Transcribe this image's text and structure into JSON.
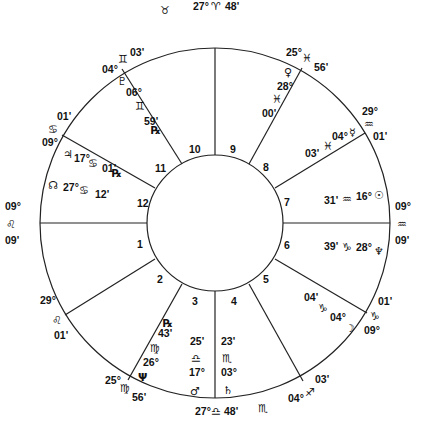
{
  "chart": {
    "house_numbers": [
      "1",
      "2",
      "3",
      "4",
      "5",
      "6",
      "7",
      "8",
      "9",
      "10",
      "11",
      "12"
    ],
    "cusps": {
      "mc": {
        "deg": "27°",
        "sign": "♈",
        "min": "48'"
      },
      "ic": {
        "deg": "27°",
        "sign": "♎",
        "min": "48'"
      },
      "asc": {
        "deg": "09°",
        "sign": "♌",
        "min": "09'"
      },
      "dsc": {
        "deg": "09°",
        "sign": "♒",
        "min": "09'"
      },
      "c11": {
        "deg": "04°",
        "sign": "♊",
        "min": "03'"
      },
      "c12": {
        "deg": "09°",
        "sign": "♋",
        "min": "01'"
      },
      "c2": {
        "deg": "29°",
        "sign": "♌",
        "min": "01'"
      },
      "c3": {
        "deg": "25°",
        "sign": "♍",
        "min": "56'"
      },
      "c5": {
        "deg": "04°",
        "sign": "♐",
        "min": "03'"
      },
      "c6": {
        "deg": "09°",
        "sign": "♑",
        "min": "01'"
      },
      "c8": {
        "deg": "29°",
        "sign": "♒",
        "min": "01'"
      },
      "c9": {
        "deg": "25°",
        "sign": "♓",
        "min": "56'"
      }
    },
    "intercepted": {
      "top": "♉",
      "bottom": "♏"
    },
    "planets": {
      "pluto_house11": {
        "glyph": "♇",
        "deg": "06°",
        "sign": "♊",
        "min": "59'",
        "retro": "℞"
      },
      "jupiter": {
        "glyph": "♃",
        "deg": "17°",
        "sign": "♋",
        "min": "01'",
        "retro": "℞"
      },
      "node_house12": {
        "glyph": "☊",
        "deg": "27°",
        "sign": "♋",
        "min": "12'"
      },
      "venus": {
        "glyph": "♀",
        "deg": "28°",
        "sign": "♓",
        "min": "00'"
      },
      "mercury": {
        "glyph": "☿",
        "deg": "04°",
        "sign": "♓",
        "min": "03'"
      },
      "sun": {
        "glyph": "☉",
        "deg": "16°",
        "sign": "♒",
        "min": "31'"
      },
      "neptune_h6": {
        "glyph": "♆",
        "deg": "28°",
        "sign": "♑",
        "min": "39'"
      },
      "moon": {
        "glyph": "☽",
        "deg": "04°",
        "sign": "♑",
        "min": "04'"
      },
      "uranus_h3": {
        "glyph": "Ψ",
        "deg": "26°",
        "sign": "♍",
        "min": "43'",
        "retro": "℞"
      },
      "mars": {
        "glyph": "♂",
        "deg": "17°",
        "sign": "♎",
        "min": "25'"
      },
      "saturn": {
        "glyph": "♄",
        "deg": "03°",
        "sign": "♏",
        "min": "23'"
      }
    }
  }
}
